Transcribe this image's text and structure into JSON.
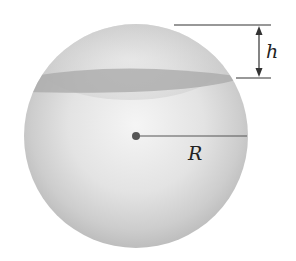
{
  "diagram": {
    "type": "sphere-with-cap",
    "labels": {
      "height": "h",
      "radius": "R"
    },
    "colors": {
      "sphere_light": "#f4f4f4",
      "sphere_mid": "#d8d8d8",
      "sphere_dark": "#b5b5b5",
      "band": "#a9a9a9",
      "line": "#333333",
      "center_dot": "#555555"
    }
  }
}
